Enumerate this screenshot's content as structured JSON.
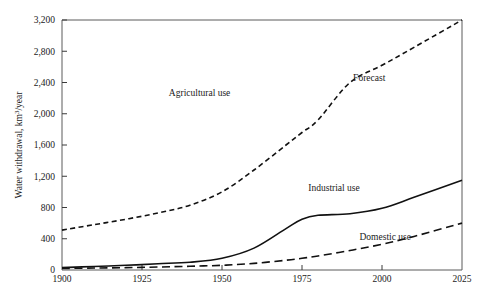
{
  "chart_data": {
    "type": "line",
    "title": "",
    "xlabel": "",
    "ylabel": "Water withdrawal, km³/year",
    "xlim": [
      1900,
      2025
    ],
    "ylim": [
      0,
      3200
    ],
    "grid": false,
    "legend_position": "inline-annotations",
    "xticks": [
      "1900",
      "1925",
      "1950",
      "1975",
      "2000",
      "2025"
    ],
    "xtick_values": [
      1900,
      1925,
      1950,
      1975,
      2000,
      2025
    ],
    "yticks": [
      "0",
      "400",
      "800",
      "1,200",
      "1,600",
      "2,000",
      "2,400",
      "2,800",
      "3,200"
    ],
    "ytick_values": [
      0,
      400,
      800,
      1200,
      1600,
      2000,
      2400,
      2800,
      3200
    ],
    "x": [
      1900,
      1910,
      1920,
      1930,
      1940,
      1950,
      1960,
      1970,
      1975,
      1980,
      1990,
      2000,
      2010,
      2025
    ],
    "series": [
      {
        "name": "Agricultural use",
        "style": "dashed-short",
        "label": "Agricultural use",
        "values": [
          510,
          580,
          650,
          730,
          830,
          1000,
          1280,
          1600,
          1760,
          1920,
          2400,
          2620,
          2850,
          3200
        ]
      },
      {
        "name": "Industrial use",
        "style": "solid",
        "label": "Industrial use",
        "values": [
          30,
          45,
          60,
          80,
          100,
          150,
          280,
          530,
          650,
          700,
          720,
          790,
          930,
          1150
        ]
      },
      {
        "name": "Domestic use",
        "style": "dashed-long",
        "label": "Domestic use",
        "values": [
          20,
          25,
          30,
          38,
          48,
          60,
          85,
          125,
          150,
          180,
          250,
          330,
          430,
          600
        ]
      }
    ],
    "annotations": [
      {
        "name": "forecast",
        "text": "Forecast",
        "x": 1996,
        "y": 2420
      },
      {
        "name": "agricultural-use",
        "text": "Agricultural use",
        "x": 1943,
        "y": 2230
      },
      {
        "name": "industrial-use",
        "text": "Industrial use",
        "x": 1985,
        "y": 1010
      },
      {
        "name": "domestic-use",
        "text": "Domestic use",
        "x": 2001,
        "y": 390
      }
    ]
  }
}
